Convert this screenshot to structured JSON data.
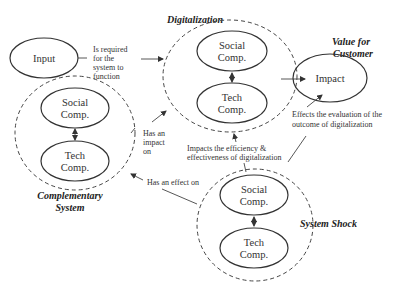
{
  "diagram": {
    "input": {
      "label": "Input"
    },
    "input_edge_label": [
      "Is required",
      "for the",
      "system to",
      "function"
    ],
    "digitalization": {
      "title": "Digitalization",
      "social": [
        "Social",
        "Comp."
      ],
      "tech": [
        "Tech",
        "Comp."
      ]
    },
    "value_for_customer": {
      "title": [
        "Value for",
        "Customer"
      ],
      "node": "Impact"
    },
    "effects_label": [
      "Effects the evaluation of the",
      "outcome of digitalization"
    ],
    "complementary": {
      "title": [
        "Complementary",
        "System"
      ],
      "social": [
        "Social",
        "Comp."
      ],
      "tech": [
        "Tech",
        "Comp."
      ]
    },
    "has_impact_label": [
      "Has an",
      "impact",
      "on"
    ],
    "impacts_efficiency_label": [
      "Impacts the efficiency &",
      "effectiveness of digitalization"
    ],
    "has_effect_label": "Has an effect on",
    "system_shock": {
      "title": "System Shock",
      "social": [
        "Social",
        "Comp."
      ],
      "tech": [
        "Tech",
        "Comp."
      ]
    }
  }
}
